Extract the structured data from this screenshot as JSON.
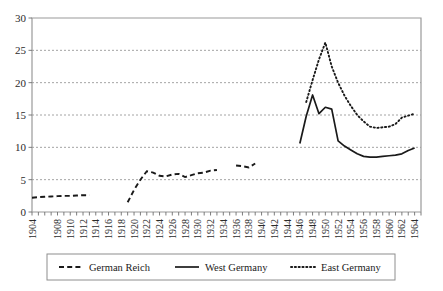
{
  "chart_data": {
    "type": "line",
    "title": "",
    "subtitle": "",
    "xlabel": "",
    "ylabel": "",
    "xlim": [
      1904,
      1965
    ],
    "ylim": [
      0,
      30
    ],
    "yticks": [
      0,
      5,
      10,
      15,
      20,
      25,
      30
    ],
    "xticks": [
      1904,
      1908,
      1910,
      1912,
      1914,
      1916,
      1918,
      1920,
      1922,
      1924,
      1926,
      1928,
      1930,
      1932,
      1934,
      1936,
      1938,
      1940,
      1942,
      1944,
      1946,
      1948,
      1950,
      1952,
      1954,
      1956,
      1958,
      1960,
      1962,
      1964
    ],
    "xtick_labels": [
      "1904",
      "1908",
      "1910",
      "1912",
      "1914",
      "1916",
      "1918",
      "1920",
      "1922",
      "1924",
      "1926",
      "1928",
      "1930",
      "1932",
      "1934",
      "1936",
      "1938",
      "1940",
      "1942",
      "1944",
      "1946",
      "1948",
      "1950",
      "1952",
      "1954",
      "1956",
      "1958",
      "1960",
      "1962",
      "1964"
    ],
    "ytick_labels": [
      "0",
      "5",
      "10",
      "15",
      "20",
      "25",
      "30"
    ],
    "grid": true,
    "grid_axis": "y",
    "legend_position": "bottom",
    "series": [
      {
        "name": "German Reich",
        "style": "dashed",
        "color": "#1a1a1a",
        "segments": [
          {
            "x": [
              1904,
              1905,
              1906,
              1907,
              1908,
              1909,
              1910,
              1911,
              1912,
              1913
            ],
            "y": [
              2.2,
              2.3,
              2.35,
              2.4,
              2.45,
              2.5,
              2.5,
              2.55,
              2.6,
              2.6
            ]
          },
          {
            "x": [
              1919,
              1920,
              1921,
              1922,
              1923,
              1924,
              1925,
              1926,
              1927,
              1928,
              1929,
              1930,
              1931,
              1932,
              1933
            ],
            "y": [
              1.5,
              3.4,
              5.0,
              6.3,
              6.1,
              5.6,
              5.5,
              5.8,
              5.9,
              5.4,
              5.7,
              6.0,
              6.1,
              6.4,
              6.5
            ]
          },
          {
            "x": [
              1936,
              1937,
              1938,
              1939
            ],
            "y": [
              7.2,
              7.1,
              6.9,
              7.5
            ]
          }
        ]
      },
      {
        "name": "West Germany",
        "style": "solid",
        "color": "#1a1a1a",
        "segments": [
          {
            "x": [
              1946,
              1947,
              1948,
              1949,
              1950,
              1951,
              1952,
              1953,
              1954,
              1955,
              1956,
              1957,
              1958,
              1959,
              1960,
              1961,
              1962,
              1963,
              1964
            ],
            "y": [
              10.6,
              14.8,
              18.1,
              15.2,
              16.2,
              15.9,
              11.0,
              10.2,
              9.6,
              9.0,
              8.6,
              8.5,
              8.5,
              8.6,
              8.7,
              8.8,
              9.0,
              9.5,
              9.9
            ]
          }
        ]
      },
      {
        "name": "East Germany",
        "style": "dotted",
        "color": "#1a1a1a",
        "segments": [
          {
            "x": [
              1947,
              1948,
              1949,
              1950,
              1951,
              1952,
              1953,
              1954,
              1955,
              1956,
              1957,
              1958,
              1959,
              1960,
              1961,
              1962,
              1963,
              1964
            ],
            "y": [
              17.0,
              20.4,
              23.6,
              26.2,
              22.5,
              20.0,
              18.0,
              16.4,
              15.0,
              14.0,
              13.2,
              13.0,
              13.1,
              13.2,
              13.6,
              14.6,
              14.9,
              15.2
            ]
          }
        ]
      }
    ]
  },
  "legend": {
    "items": [
      {
        "label": "German Reich",
        "style": "dashed"
      },
      {
        "label": "West Germany",
        "style": "solid"
      },
      {
        "label": "East Germany",
        "style": "dotted"
      }
    ]
  }
}
